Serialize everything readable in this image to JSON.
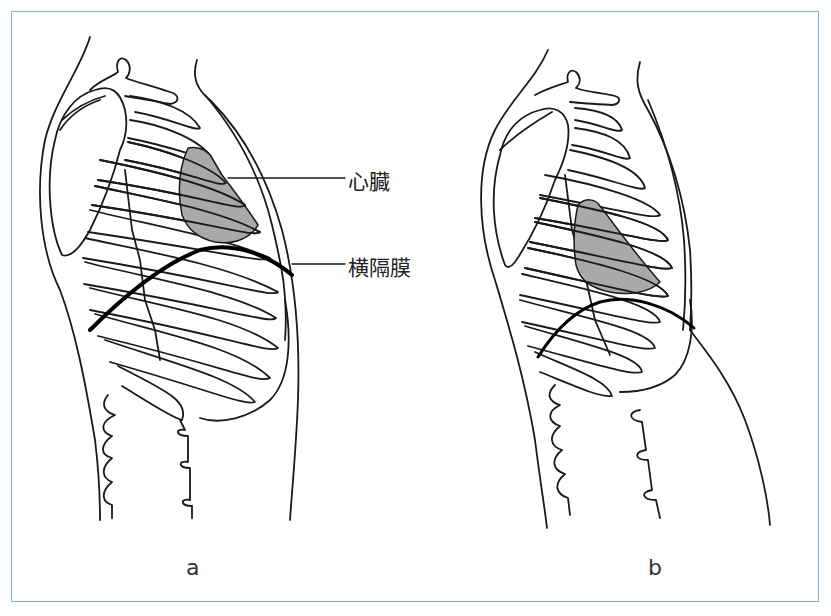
{
  "figure": {
    "panels": [
      {
        "id": "a",
        "caption": "a",
        "description": "lateral thorax with diaphragm high, heart shaded"
      },
      {
        "id": "b",
        "caption": "b",
        "description": "lateral thorax with diaphragm lowered, protruding abdomen"
      }
    ],
    "labels": {
      "heart": "心臓",
      "diaphragm": "横隔膜"
    },
    "colors": {
      "frame": "#7fb3d9",
      "line": "#1a1a1a",
      "heart_fill": "#a9a9a9",
      "diaphragm": "#000000"
    }
  }
}
